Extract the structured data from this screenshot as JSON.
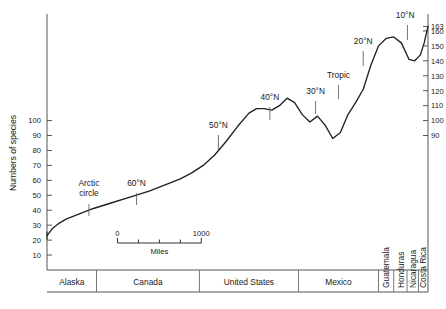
{
  "chart_data": {
    "type": "line",
    "title": "",
    "subtitle": "",
    "xlabel": "",
    "ylabel": "Numbers of species",
    "grid": false,
    "legend": "none",
    "ylim": [
      0,
      170
    ],
    "xlim": [
      0,
      100
    ],
    "left_axis": {
      "label": "Numbers of species",
      "ticks": [
        "100",
        "90",
        "80",
        "70",
        "60",
        "50",
        "40",
        "30",
        "20",
        "10"
      ],
      "tick_values": [
        100,
        90,
        80,
        70,
        60,
        50,
        40,
        30,
        20,
        10
      ]
    },
    "right_axis": {
      "ticks": [
        "163",
        "160",
        "150",
        "140",
        "130",
        "120",
        "110",
        "100",
        "90"
      ],
      "tick_values": [
        163,
        160,
        150,
        140,
        130,
        120,
        110,
        100,
        90
      ]
    },
    "x_regions": [
      {
        "name": "Alaska",
        "label": "Alaska"
      },
      {
        "name": "Canada",
        "label": "Canada"
      },
      {
        "name": "United States",
        "label": "United States"
      },
      {
        "name": "Mexico",
        "label": "Mexico"
      },
      {
        "name": "Guatemala",
        "label": "Guatemala"
      },
      {
        "name": "Honduras",
        "label": "Honduras"
      },
      {
        "name": "Nicaragua",
        "label": "Nicaragua"
      },
      {
        "name": "Costa Rica",
        "label": "Costa Rica"
      }
    ],
    "annotations": [
      {
        "label": "Arctic circle",
        "line1": "Arctic",
        "line2": "circle"
      },
      {
        "label": "60°N"
      },
      {
        "label": "50°N"
      },
      {
        "label": "40°N"
      },
      {
        "label": "30°N"
      },
      {
        "label": "Tropic"
      },
      {
        "label": "20°N"
      },
      {
        "label": "10°N"
      }
    ],
    "scale_bar": {
      "start_label": "0",
      "end_label": "1000",
      "unit_label": "Miles"
    },
    "x": [
      0,
      1.5,
      3,
      5,
      8,
      12,
      17,
      22,
      27,
      31,
      35,
      38,
      41,
      44,
      47,
      50,
      53,
      55,
      57,
      59,
      61,
      63,
      65,
      67,
      69,
      71,
      73,
      75,
      77,
      79,
      81,
      83,
      85,
      87,
      89,
      91,
      93,
      95,
      96.5,
      98,
      99,
      100
    ],
    "values": [
      23,
      28,
      31,
      34,
      37,
      41,
      45,
      49,
      53,
      57,
      61,
      65,
      70,
      77,
      86,
      96,
      105,
      108,
      108,
      107,
      110,
      115,
      112,
      104,
      99,
      103,
      97,
      88,
      92,
      104,
      112,
      121,
      137,
      150,
      155,
      156,
      152,
      141,
      140,
      144,
      152,
      163
    ],
    "series": [
      {
        "name": "Numbers of species",
        "values": [
          23,
          28,
          31,
          34,
          37,
          41,
          45,
          49,
          53,
          57,
          61,
          65,
          70,
          77,
          86,
          96,
          105,
          108,
          108,
          107,
          110,
          115,
          112,
          104,
          99,
          103,
          97,
          88,
          92,
          104,
          112,
          121,
          137,
          150,
          155,
          156,
          152,
          141,
          140,
          144,
          152,
          163
        ]
      }
    ]
  }
}
